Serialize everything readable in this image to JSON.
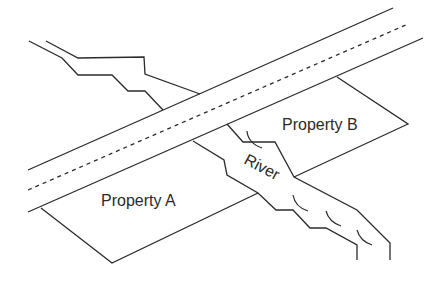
{
  "diagram": {
    "labels": {
      "property_a": "Property A",
      "property_b": "Property B",
      "river": "River"
    },
    "elements": {
      "road": "road with dashed center line",
      "river": "river crossing under the road",
      "property_a": "parcel south-west of river, below road",
      "property_b": "parcel north-east of river, below road"
    },
    "colors": {
      "line": "#2b2b2b",
      "background": "#ffffff"
    }
  }
}
